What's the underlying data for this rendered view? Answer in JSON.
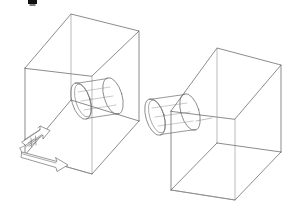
{
  "figure": {
    "title": "Isometric wireframe assembly drawing",
    "background_color": "#ffffff",
    "line_color": "#5a5a5a",
    "secondary_line_color": "#8d8d8d",
    "cylinder_line_color": "#6b6b6b",
    "arrow_line_color": "#6f6f6f",
    "arrow_fill_color": "#ffffff",
    "mark_color": "#111111",
    "canvas": {
      "width": 292,
      "height": 220
    }
  },
  "marks": {
    "top_artifact_label": "",
    "top_artifact_name": "cropped-caption-mark"
  },
  "objects": [
    {
      "id": "left-assembly",
      "name": "left-box-assembly",
      "label": "",
      "box": {
        "name": "left-wireframe-box",
        "type": "open-top-rectangular-enclosure",
        "projection": "isometric"
      },
      "cylinder": {
        "name": "left-cylinder",
        "placement": "inside-enclosure",
        "orientation": "horizontal-axis",
        "end_caps": 2
      },
      "arrows": [
        {
          "name": "upper-direction-arrow",
          "direction": "right-up",
          "style": "block-arrow",
          "label": ""
        },
        {
          "name": "lower-direction-arrow",
          "direction": "right-down",
          "style": "block-arrow",
          "label": ""
        }
      ]
    },
    {
      "id": "right-assembly",
      "name": "right-box-assembly",
      "label": "",
      "box": {
        "name": "right-wireframe-box",
        "type": "open-top-rectangular-enclosure",
        "projection": "isometric"
      },
      "cylinder": {
        "name": "right-cylinder",
        "placement": "protruding-from-left-face",
        "orientation": "horizontal-axis",
        "end_caps": 2
      },
      "arrows": []
    }
  ]
}
